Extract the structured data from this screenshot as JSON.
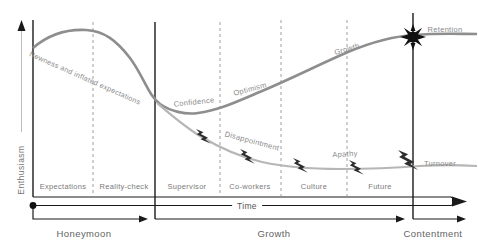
{
  "axes": {
    "y": "Enthusiasm",
    "x": "Time"
  },
  "annotations": {
    "newness": "Newness and inflated expectations",
    "confidence": "Confidence",
    "optimism": "Optimism",
    "growth": "Growth",
    "retention": "Retention",
    "disappointment": "Disappointment",
    "apathy": "Apathy",
    "turnover": "Turnover"
  },
  "sections": [
    "Expectations",
    "Reality-check",
    "Supervisor",
    "Co-workers",
    "Culture",
    "Future"
  ],
  "phases": [
    "Honeymoon",
    "Growth",
    "Contentment"
  ],
  "icons": {
    "lightning_bolt": "setback-lightning-bolt",
    "burst": "retention-burst-star"
  },
  "colors": {
    "top_curve": "#8e8e8e",
    "bottom_curve": "#b6b6b6",
    "axis": "#1a1a1a",
    "dashed_line": "#a0a0a0",
    "annotation_text": "#8a8a8a",
    "section_text": "#7a7a7a",
    "phase_text": "#636363",
    "background": "#ffffff"
  }
}
